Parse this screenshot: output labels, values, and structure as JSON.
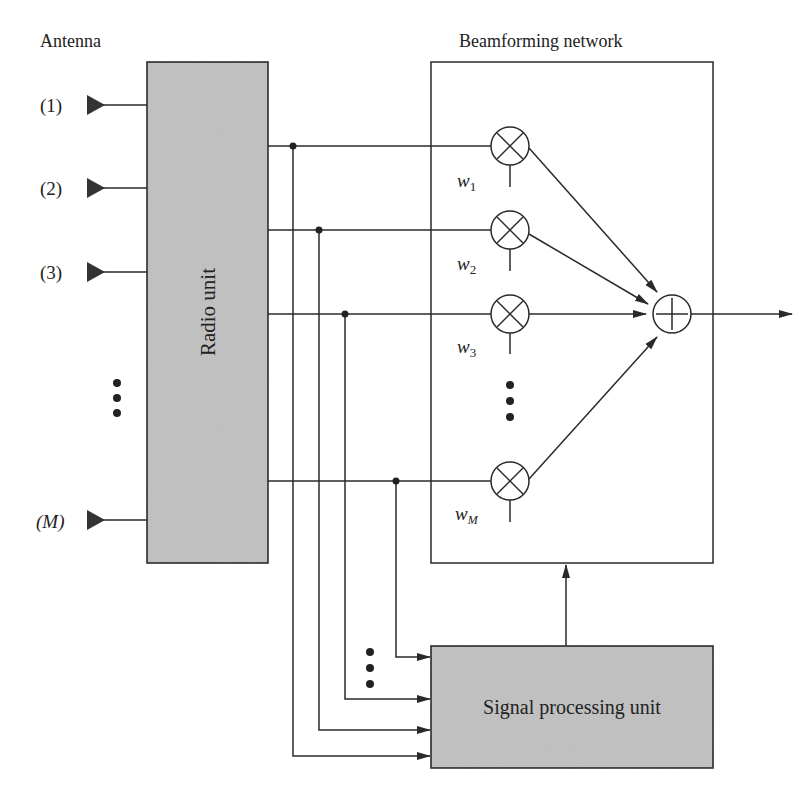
{
  "diagram": {
    "top_partial_text": "",
    "antenna_title": "Antenna",
    "beamforming_title": "Beamforming network",
    "radio_unit_label": "Radio unit",
    "signal_processing_label": "Signal processing unit",
    "antennas": [
      {
        "label": "(1)",
        "y": 105
      },
      {
        "label": "(2)",
        "y": 188
      },
      {
        "label": "(3)",
        "y": 272
      },
      {
        "label": "(M)",
        "y": 520
      }
    ],
    "weights": [
      {
        "symbol": "w",
        "sub": "1"
      },
      {
        "symbol": "w",
        "sub": "2"
      },
      {
        "symbol": "w",
        "sub": "3"
      },
      {
        "symbol": "w",
        "sub": "M"
      }
    ],
    "colors": {
      "box_fill": "#c4c4c4",
      "stroke": "#2a2a2a",
      "background": "#ffffff"
    }
  }
}
